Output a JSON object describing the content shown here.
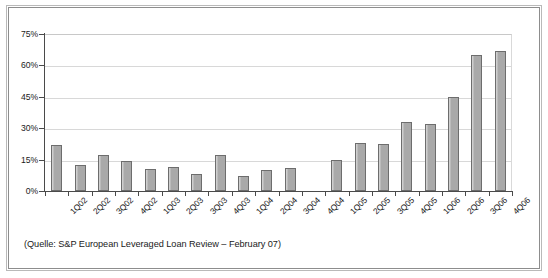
{
  "source_note": "(Quelle: S&P European Leveraged Loan Review – February 07)",
  "colors": {
    "bar_fill": "#a9a9a9",
    "bar_border": "#6d6d6d",
    "gridline": "#d8d8d8",
    "axis": "#4a4a4a",
    "frame_outer": "#b9b9b9",
    "frame_inner": "#8d8d8d",
    "text": "#1a1a1a",
    "background": "#ffffff"
  },
  "chart_data": {
    "type": "bar",
    "title": "",
    "subtitle": "",
    "xlabel": "",
    "ylabel": "",
    "ylim": [
      0,
      75
    ],
    "yticks": [
      0,
      15,
      30,
      45,
      60,
      75
    ],
    "ytick_labels": [
      "0%",
      "15%",
      "30%",
      "45%",
      "60%",
      "75%"
    ],
    "grid": true,
    "legend": false,
    "legend_position": "none",
    "annotation": "(Quelle: S&P European Leveraged Loan Review – February 07)",
    "categories": [
      "1Q02",
      "2Q02",
      "3Q02",
      "4Q02",
      "1Q03",
      "2Q03",
      "3Q03",
      "4Q03",
      "1Q04",
      "2Q04",
      "3Q04",
      "4Q04",
      "1Q05",
      "2Q05",
      "3Q05",
      "4Q05",
      "1Q06",
      "2Q06",
      "3Q06",
      "4Q06"
    ],
    "values": [
      22,
      12.5,
      17,
      14.5,
      10.5,
      11.5,
      8,
      17,
      7,
      10,
      11,
      0,
      15,
      23,
      22.5,
      33,
      32,
      45,
      65,
      67
    ]
  }
}
